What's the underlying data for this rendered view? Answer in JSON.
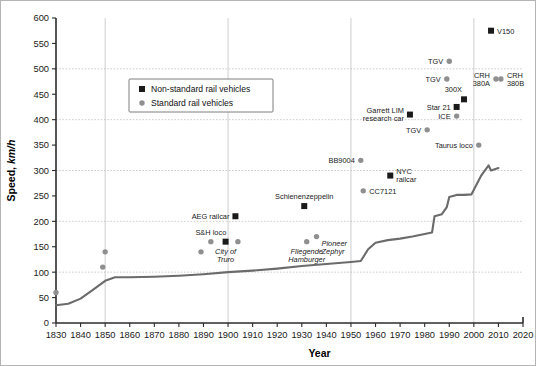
{
  "chart_data": {
    "type": "scatter",
    "title": "",
    "xlabel": "Year",
    "ylabel": "Speed, km/h",
    "ylabel_main": "Speed, ",
    "ylabel_unit": "km/h",
    "xlim": [
      1830,
      2020
    ],
    "ylim": [
      0,
      600
    ],
    "xticks": [
      1830,
      1840,
      1850,
      1860,
      1870,
      1880,
      1890,
      1900,
      1910,
      1920,
      1930,
      1940,
      1950,
      1960,
      1970,
      1980,
      1990,
      2000,
      2010,
      2020
    ],
    "yticks": [
      0,
      50,
      100,
      150,
      200,
      250,
      300,
      350,
      400,
      450,
      500,
      550,
      600
    ],
    "grid": "major gridlines at y=100,200,300,400,500 and x=1850,1900,1950,2000",
    "gridlines_y": [
      100,
      200,
      300,
      400,
      500
    ],
    "gridlines_x": [
      1850,
      1900,
      1950,
      2000
    ],
    "legend_position": "upper-left-inside",
    "legend": [
      {
        "marker": "square",
        "color": "#1a1a1a",
        "label": "Non-standard rail vehicles"
      },
      {
        "marker": "circle",
        "color": "#8f8f8f",
        "label": "Standard rail vehicles"
      }
    ],
    "series": [
      {
        "name": "Non-standard rail vehicles",
        "marker": "square",
        "color": "#1a1a1a",
        "points": [
          {
            "x": 1903,
            "y": 210,
            "label": "AEG railcar",
            "label_pos": "left",
            "italic": false
          },
          {
            "x": 1899,
            "y": 160,
            "label": "City of\nTruro",
            "label_pos": "below",
            "italic": true
          },
          {
            "x": 1931,
            "y": 230,
            "label": "Schienenzeppelin",
            "label_pos": "above",
            "italic": false
          },
          {
            "x": 1966,
            "y": 290,
            "label": "NYC\nrailcar",
            "label_pos": "right",
            "italic": false
          },
          {
            "x": 1974,
            "y": 410,
            "label": "Garrett LIM\nresearch car",
            "label_pos": "left",
            "italic": false
          },
          {
            "x": 1993,
            "y": 425,
            "label": "Star 21",
            "label_pos": "left",
            "italic": false
          },
          {
            "x": 1996,
            "y": 440,
            "label": "300X",
            "label_pos": "above-left",
            "italic": false
          },
          {
            "x": 2007,
            "y": 575,
            "label": "V150",
            "label_pos": "right",
            "italic": false
          }
        ]
      },
      {
        "name": "Standard rail vehicles",
        "marker": "circle",
        "color": "#8f8f8f",
        "points": [
          {
            "x": 1830,
            "y": 60,
            "label": "",
            "label_pos": "none",
            "italic": false
          },
          {
            "x": 1849,
            "y": 110,
            "label": "",
            "label_pos": "none",
            "italic": false
          },
          {
            "x": 1850,
            "y": 140,
            "label": "",
            "label_pos": "none",
            "italic": false
          },
          {
            "x": 1889,
            "y": 140,
            "label": "",
            "label_pos": "none",
            "italic": false
          },
          {
            "x": 1893,
            "y": 160,
            "label": "S&H loco",
            "label_pos": "above",
            "italic": false
          },
          {
            "x": 1904,
            "y": 160,
            "label": "",
            "label_pos": "none",
            "italic": false
          },
          {
            "x": 1932,
            "y": 160,
            "label": "Fliegende\nHamburger",
            "label_pos": "below",
            "italic": true
          },
          {
            "x": 1936,
            "y": 170,
            "label": "Pioneer\nZephyr",
            "label_pos": "right-below",
            "italic": true
          },
          {
            "x": 1954,
            "y": 320,
            "label": "BB9004",
            "label_pos": "left",
            "italic": false
          },
          {
            "x": 1955,
            "y": 260,
            "label": "CC7121",
            "label_pos": "right",
            "italic": false
          },
          {
            "x": 1981,
            "y": 380,
            "label": "TGV",
            "label_pos": "left",
            "italic": false
          },
          {
            "x": 1989,
            "y": 480,
            "label": "TGV",
            "label_pos": "left",
            "italic": false
          },
          {
            "x": 1990,
            "y": 515,
            "label": "TGV",
            "label_pos": "left",
            "italic": false
          },
          {
            "x": 1993,
            "y": 407,
            "label": "ICE",
            "label_pos": "left",
            "italic": false
          },
          {
            "x": 2002,
            "y": 350,
            "label": "Taurus loco",
            "label_pos": "left",
            "italic": false
          },
          {
            "x": 2009,
            "y": 480,
            "label": "CRH\n380A",
            "label_pos": "left",
            "italic": false
          },
          {
            "x": 2011,
            "y": 480,
            "label": "CRH\n380B",
            "label_pos": "right",
            "italic": false
          }
        ]
      },
      {
        "name": "Speed record envelope",
        "marker": "line",
        "color": "#6b6b6b",
        "x": [
          1830,
          1835,
          1840,
          1845,
          1850,
          1854,
          1860,
          1870,
          1880,
          1890,
          1900,
          1910,
          1920,
          1930,
          1940,
          1950,
          1954,
          1957,
          1960,
          1965,
          1970,
          1975,
          1980,
          1983,
          1984,
          1987,
          1989,
          1990,
          1993,
          1996,
          1999,
          2003,
          2006,
          2007,
          2010
        ],
        "y": [
          35,
          38,
          48,
          65,
          83,
          90,
          90,
          91,
          93,
          96,
          100,
          103,
          107,
          112,
          116,
          120,
          122,
          145,
          158,
          163,
          166,
          170,
          175,
          178,
          210,
          214,
          228,
          248,
          252,
          252,
          253,
          290,
          310,
          300,
          305
        ]
      }
    ]
  }
}
